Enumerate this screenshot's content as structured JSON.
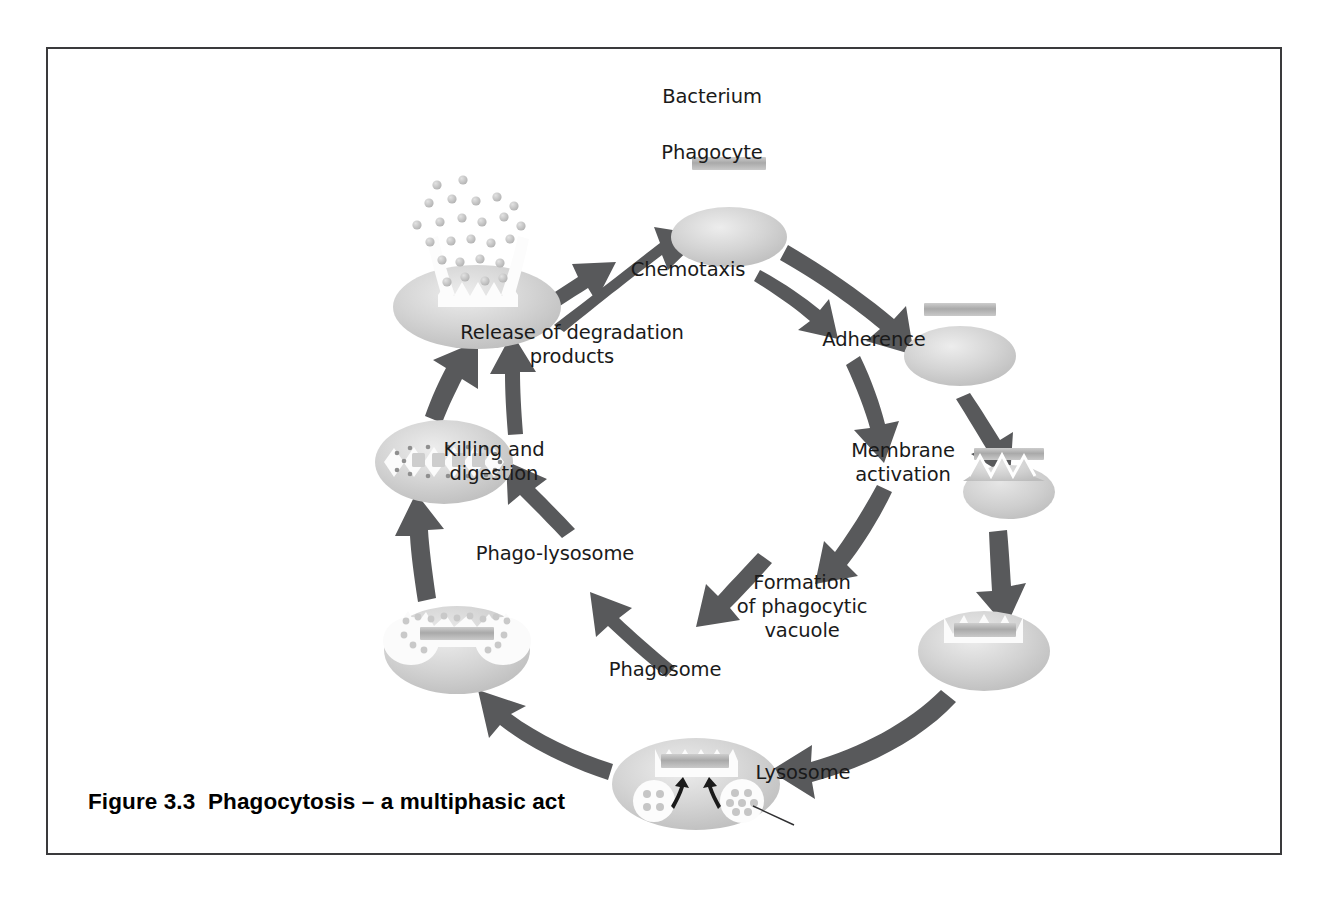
{
  "figure": {
    "caption": "Figure 3.3  Phagocytosis – a multiphasic act",
    "border_color": "#3a3a3c",
    "background": "#ffffff"
  },
  "palette": {
    "arrow_gray": "#58595b",
    "cell_fill_light": "#d6d6d6",
    "cell_fill_mid": "#c2c2c2",
    "cell_highlight": "#ebebeb",
    "bacterium_gray": "#b6b6b6",
    "text_color": "#1a1a1a",
    "vacuole_white": "#fdfdfd",
    "leader_line": "#2f2f31"
  },
  "labels": [
    {
      "id": "bacterium",
      "text": "Bacterium",
      "x": 664,
      "y": 46,
      "lines": 1
    },
    {
      "id": "phagocyte",
      "text": "Phagocyte",
      "x": 664,
      "y": 102,
      "lines": 1
    },
    {
      "id": "chemotaxis",
      "text": "Chemotaxis",
      "x": 640,
      "y": 219,
      "lines": 1
    },
    {
      "id": "adherence",
      "text": "Adherence",
      "x": 826,
      "y": 289,
      "lines": 1
    },
    {
      "id": "membrane-activation",
      "text": "Membrane\nactivation",
      "x": 855,
      "y": 410,
      "lines": 2
    },
    {
      "id": "formation-of-phagocytic-vacuole",
      "text": "Formation\nof phagocytic\nvacuole",
      "x": 754,
      "y": 550,
      "lines": 3
    },
    {
      "id": "phagosome",
      "text": "Phagosome",
      "x": 617,
      "y": 619,
      "lines": 1
    },
    {
      "id": "lysosome",
      "text": "Lysosome",
      "x": 755,
      "y": 722,
      "lines": 1
    },
    {
      "id": "phago-lysosome",
      "text": "Phago-lysosome",
      "x": 507,
      "y": 503,
      "lines": 1
    },
    {
      "id": "killing-and-digestion",
      "text": "Killing and\ndigestion",
      "x": 446,
      "y": 409,
      "lines": 2
    },
    {
      "id": "release-of-degradation-products",
      "text": "Release of degradation\nproducts",
      "x": 524,
      "y": 282,
      "lines": 2
    }
  ],
  "cells": [
    {
      "id": "phagocyte-cell",
      "stage": "resting phagocyte",
      "cx": 681,
      "cy": 188,
      "rx": 58,
      "ry": 30
    },
    {
      "id": "bacterium-top",
      "stage": "free bacterium",
      "cx": 681,
      "cy": 114,
      "w": 74,
      "h": 13
    },
    {
      "id": "adherence-cell",
      "stage": "bacterium adhered to surface",
      "cx": 912,
      "cy": 307,
      "rx": 56,
      "ry": 30
    },
    {
      "id": "membrane-activation-cell",
      "stage": "membrane activated / ruffled",
      "cx": 961,
      "cy": 443,
      "rx": 46,
      "ry": 27
    },
    {
      "id": "vacuole-formation-cell",
      "stage": "phagocytic vacuole forming",
      "cx": 936,
      "cy": 602,
      "rx": 66,
      "ry": 40
    },
    {
      "id": "phagosome-cell",
      "stage": "phagosome with lysosomes",
      "cx": 648,
      "cy": 735,
      "rx": 84,
      "ry": 46
    },
    {
      "id": "phago-lysosome-cell",
      "stage": "phago-lysosome fused",
      "cx": 409,
      "cy": 601,
      "rx": 73,
      "ry": 44
    },
    {
      "id": "digestion-cell",
      "stage": "killing and digestion",
      "cx": 396,
      "cy": 413,
      "rx": 69,
      "ry": 42
    },
    {
      "id": "release-cell",
      "stage": "release of degradation products",
      "cx": 429,
      "cy": 258,
      "rx": 84,
      "ry": 42
    }
  ],
  "arrows": [
    {
      "id": "arrow-release-to-phagocyte",
      "from": "release-cell",
      "to": "phagocyte-cell"
    },
    {
      "id": "arrow-phagocyte-to-adherence",
      "from": "phagocyte-cell",
      "to": "adherence-cell"
    },
    {
      "id": "arrow-adherence-to-activation",
      "from": "adherence-cell",
      "to": "membrane-activation-cell"
    },
    {
      "id": "arrow-activation-to-vacuole",
      "from": "membrane-activation-cell",
      "to": "vacuole-formation-cell"
    },
    {
      "id": "arrow-vacuole-to-phagosome",
      "from": "vacuole-formation-cell",
      "to": "phagosome-cell"
    },
    {
      "id": "arrow-phagosome-to-phagolysosome",
      "from": "phagosome-cell",
      "to": "phago-lysosome-cell"
    },
    {
      "id": "arrow-phagolysosome-to-digestion",
      "from": "phago-lysosome-cell",
      "to": "digestion-cell"
    },
    {
      "id": "arrow-digestion-to-release",
      "from": "digestion-cell",
      "to": "release-cell"
    },
    {
      "id": "arrow-inner-chemotaxis",
      "from": "release label",
      "to": "Chemotaxis"
    },
    {
      "id": "arrow-inner-adherence",
      "from": "Chemotaxis",
      "to": "Adherence"
    },
    {
      "id": "arrow-inner-membrane-activation",
      "from": "Adherence",
      "to": "Membrane activation"
    },
    {
      "id": "arrow-inner-vacuole",
      "from": "Membrane activation",
      "to": "Formation of phagocytic vacuole"
    },
    {
      "id": "arrow-inner-phagosome",
      "from": "Formation of phagocytic vacuole",
      "to": "Phagosome"
    },
    {
      "id": "arrow-inner-phagolysosome",
      "from": "Phagosome",
      "to": "Phago-lysosome"
    },
    {
      "id": "arrow-inner-killing",
      "from": "Phago-lysosome",
      "to": "Killing and digestion"
    },
    {
      "id": "arrow-inner-release",
      "from": "Killing and digestion",
      "to": "Release of degradation products"
    }
  ]
}
